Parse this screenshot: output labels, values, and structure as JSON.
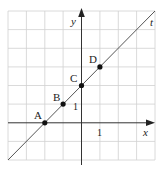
{
  "diagram": {
    "type": "coordinate-grid-line",
    "grid": {
      "cols": 8,
      "rows": 8,
      "x_range": [
        -4,
        4
      ],
      "y_range": [
        -2,
        6
      ]
    },
    "axes": {
      "x_label": "x",
      "y_label": "y",
      "x_tick": "1",
      "y_tick": "1"
    },
    "line": {
      "label": "t",
      "equation": "y = x + 2"
    },
    "points": [
      {
        "label": "A",
        "x": -2,
        "y": 0
      },
      {
        "label": "B",
        "x": -1,
        "y": 1
      },
      {
        "label": "C",
        "x": 0,
        "y": 2
      },
      {
        "label": "D",
        "x": 1,
        "y": 3
      }
    ],
    "colors": {
      "grid": "#d0d0d0",
      "axis": "#333333",
      "line": "#555555",
      "point": "#111111"
    }
  }
}
